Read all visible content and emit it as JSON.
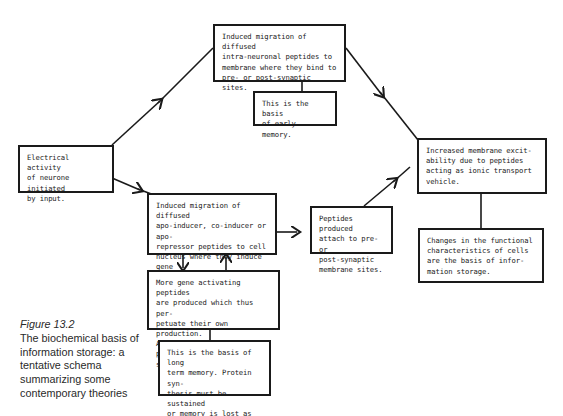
{
  "diagram": {
    "boxes": {
      "top": "Induced migration of diffused\nintra-neuronal peptides to\nmembrane where they bind to\npre- or post-synaptic sites.",
      "early_memory": "This is the basis\nof early memory.",
      "electrical": "Electrical activity\nof neurone initiated\nby input.",
      "apo_inducer": "Induced migration of diffused\napo-inducer, co-inducer or apo-\nrepressor peptides to cell\nnucleus where they induce gene\nactivity manifest in protein\n(peptide) synthesis.",
      "peptides_attach": "Peptides produced\nattach to pre- or\npost-synaptic\nmembrane sites.",
      "excitability": "Increased membrane excit-\nability due to peptides\nacting as ionic transport\nvehicle.",
      "changes": "Changes in the functional\ncharacteristics of cells\nare the basis of infor-\nmation storage.",
      "more_gene": "More gene activating peptides\nare produced which thus per-\npetuate their own production.\nA new stable level of protein\nsynthesis is established.",
      "long_term": "This is the basis of long\nterm memory.  Protein syn-\nthesis must be sustained\nor memory is lost as exis-\nting proteins are degraded."
    },
    "colors": {
      "ink": "#1a1a1a",
      "background": "#ffffff"
    }
  },
  "caption": {
    "figure_label": "Figure 13.2",
    "text": "The biochemical basis of information storage: a tentative schema summarizing some contemporary theories"
  }
}
